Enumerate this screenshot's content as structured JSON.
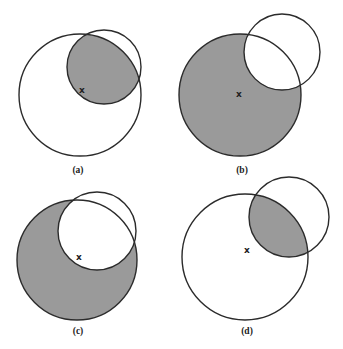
{
  "figure": {
    "width": 343,
    "height": 349,
    "background": "#ffffff",
    "shade_color": "#9a9a9a",
    "stroke_color": "#2b2b2b",
    "center_mark": "x",
    "panels": [
      {
        "id": "a",
        "label": "(a)",
        "shaded_region": "intersection",
        "big_circle": {
          "cx": 80,
          "cy": 95,
          "r": 61
        },
        "small_circle": {
          "cx": 104,
          "cy": 67,
          "r": 37
        },
        "mark": {
          "x": 82,
          "y": 90
        },
        "label_pos": {
          "x": 78,
          "y": 170
        }
      },
      {
        "id": "b",
        "label": "(b)",
        "shaded_region": "big-minus-small",
        "big_circle": {
          "cx": 240,
          "cy": 95,
          "r": 61
        },
        "small_circle": {
          "cx": 282,
          "cy": 52,
          "r": 38
        },
        "mark": {
          "x": 239,
          "y": 94
        },
        "label_pos": {
          "x": 242,
          "y": 170
        }
      },
      {
        "id": "c",
        "label": "(c)",
        "shaded_region": "big-minus-small",
        "big_circle": {
          "cx": 77,
          "cy": 260,
          "r": 60
        },
        "small_circle": {
          "cx": 97,
          "cy": 231,
          "r": 39
        },
        "mark": {
          "x": 79,
          "y": 257
        },
        "label_pos": {
          "x": 78,
          "y": 331
        }
      },
      {
        "id": "d",
        "label": "(d)",
        "shaded_region": "intersection",
        "big_circle": {
          "cx": 245,
          "cy": 257,
          "r": 63
        },
        "small_circle": {
          "cx": 289,
          "cy": 217,
          "r": 40
        },
        "mark": {
          "x": 247,
          "y": 250
        },
        "label_pos": {
          "x": 247,
          "y": 331
        }
      }
    ]
  }
}
